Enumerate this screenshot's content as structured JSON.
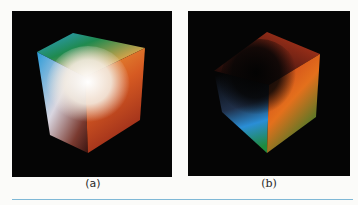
{
  "figure": {
    "panels": [
      {
        "id": "a",
        "caption": "(a)",
        "description": "RGB color cube viewed from the white corner",
        "colors": {
          "top": "#1e8a4a",
          "left": "#2a9ad8",
          "center": "#f6f4ee",
          "right": "#e8892a",
          "bottom": "#b0402a"
        }
      },
      {
        "id": "b",
        "caption": "(b)",
        "description": "RGB color cube viewed from the black corner",
        "colors": {
          "top": "#b0301c",
          "left": "#2a8ed6",
          "center": "#050505",
          "right": "#e47a1c",
          "bottom": "#1f8a3c"
        }
      }
    ],
    "background": "#050505",
    "rule_color": "#7fb8d6"
  }
}
